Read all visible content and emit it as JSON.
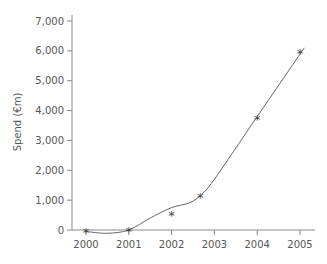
{
  "chart_data": {
    "type": "scatter",
    "title": "",
    "xlabel": "",
    "ylabel": "Spend (€m)",
    "xlim": [
      1999.9,
      2005.3
    ],
    "ylim": [
      0,
      7000
    ],
    "x_ticks": [
      2000,
      2001,
      2002,
      2003,
      2004,
      2005
    ],
    "y_ticks": [
      0,
      1000,
      2000,
      3000,
      4000,
      5000,
      6000,
      7000
    ],
    "y_tick_labels": [
      "0",
      "1,000",
      "2,000",
      "3,000",
      "4,000",
      "5,000",
      "6,000",
      "7,000"
    ],
    "grid": false,
    "legend": null,
    "series": [
      {
        "name": "Spend",
        "marker": "*",
        "points": [
          {
            "x": 2000,
            "y": -30
          },
          {
            "x": 2001,
            "y": 0
          },
          {
            "x": 2002,
            "y": 550
          },
          {
            "x": 2002.67,
            "y": 1150
          },
          {
            "x": 2004,
            "y": 3750
          },
          {
            "x": 2005,
            "y": 5950
          }
        ]
      },
      {
        "name": "Trend (smoothed fit)",
        "type": "line",
        "points": [
          {
            "x": 2000,
            "y": -50
          },
          {
            "x": 2000.5,
            "y": -110
          },
          {
            "x": 2001,
            "y": 0
          },
          {
            "x": 2001.5,
            "y": 400
          },
          {
            "x": 2002,
            "y": 750
          },
          {
            "x": 2002.4,
            "y": 900
          },
          {
            "x": 2002.67,
            "y": 1150
          },
          {
            "x": 2003,
            "y": 1700
          },
          {
            "x": 2004,
            "y": 3800
          },
          {
            "x": 2005.1,
            "y": 6100
          }
        ]
      }
    ]
  }
}
